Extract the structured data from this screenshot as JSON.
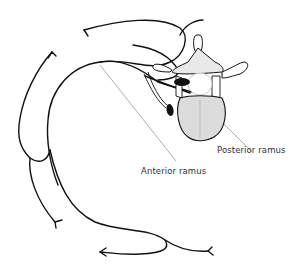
{
  "diagram": {
    "type": "anatomical-line-drawing",
    "labels": {
      "posterior_ramus": "Posterior ramus",
      "anterior_ramus": "Anterior ramus"
    },
    "colors": {
      "line": "#111111",
      "leader": "#9a9a9a",
      "text": "#333333",
      "background": "#ffffff"
    }
  }
}
